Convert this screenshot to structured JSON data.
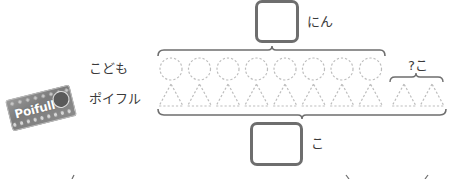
{
  "diagram": {
    "top_answer": {
      "value": "",
      "suffix": "にん"
    },
    "bottom_answer": {
      "value": "",
      "suffix": "こ"
    },
    "unknown_label": "?こ",
    "rows": [
      {
        "label": "こども",
        "shape": "circle",
        "count": 8
      },
      {
        "label": "ポイフル",
        "shape": "triangle",
        "count": 10
      }
    ],
    "product_image": {
      "brand_text": "Poifull"
    },
    "colors": {
      "dashed_shape": "#bdbdbd",
      "brace": "#6e6e6e",
      "box_border": "#6e6e6e",
      "text": "#3a3a3a"
    }
  }
}
